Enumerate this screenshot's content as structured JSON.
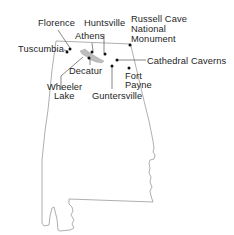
{
  "map": {
    "region": "Alabama",
    "colors": {
      "outline": "#9a9a9a",
      "text": "#1e1e1e",
      "marker": "#111111",
      "lake": "#bdbdbd"
    },
    "labels": {
      "florence": "Florence",
      "huntsville": "Huntsville",
      "russell_cave_1": "Russell Cave",
      "russell_cave_2": "National",
      "russell_cave_3": "Monument",
      "athens": "Athens",
      "tuscumbia": "Tuscumbia",
      "cathedral_caverns": "Cathedral Caverns",
      "decatur": "Decatur",
      "fort_payne_1": "Fort",
      "fort_payne_2": "Payne",
      "wheeler_lake_1": "Wheeler",
      "wheeler_lake_2": "Lake",
      "guntersville": "Guntersville"
    }
  }
}
